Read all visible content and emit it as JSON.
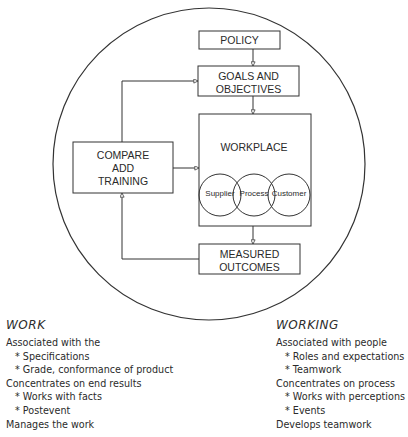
{
  "diagram": {
    "boxes": {
      "policy": "POLICY",
      "goals": [
        "GOALS AND",
        "OBJECTIVES"
      ],
      "workplace": "WORKPLACE",
      "compare": [
        "COMPARE",
        "ADD",
        "TRAINING"
      ],
      "measured": [
        "MEASURED",
        "OUTCOMES"
      ]
    },
    "circles": [
      "Supplier",
      "Process",
      "Customer"
    ]
  },
  "work": {
    "title": "WORK",
    "lines": [
      {
        "text": "Associated with the",
        "indent": false
      },
      {
        "text": "* Specifications",
        "indent": true
      },
      {
        "text": "* Grade, conformance of product",
        "indent": true
      },
      {
        "text": "Concentrates on end results",
        "indent": false
      },
      {
        "text": "* Works with facts",
        "indent": true
      },
      {
        "text": "* Postevent",
        "indent": true
      },
      {
        "text": "Manages the work",
        "indent": false
      }
    ]
  },
  "working": {
    "title": "WORKING",
    "lines": [
      {
        "text": "Associated with people",
        "indent": false
      },
      {
        "text": "* Roles and expectations",
        "indent": true
      },
      {
        "text": "* Teamwork",
        "indent": true
      },
      {
        "text": "Concentrates on process",
        "indent": false
      },
      {
        "text": "* Works with perceptions",
        "indent": true
      },
      {
        "text": "* Events",
        "indent": true
      },
      {
        "text": "Develops teamwork",
        "indent": false
      }
    ]
  },
  "colors": {
    "stroke": "#333333",
    "text": "#2b2b2b",
    "background": "#ffffff"
  }
}
